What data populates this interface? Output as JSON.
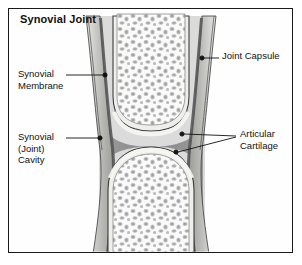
{
  "figure": {
    "title": "Synovial Joint",
    "frame_color": "#1a1a1a",
    "background": "#ffffff"
  },
  "labels": [
    {
      "id": "joint-capsule",
      "text": "Joint Capsule",
      "x": 222,
      "y": 54,
      "align": "left"
    },
    {
      "id": "synovial-membrane",
      "text_line1": "Synovial",
      "text_line2": "Membrane",
      "x": 18,
      "y": 72,
      "align": "left"
    },
    {
      "id": "synovial-cavity",
      "text_line1": "Synovial",
      "text_line2": "(Joint)",
      "text_line3": "Cavity",
      "x": 18,
      "y": 134,
      "align": "left"
    },
    {
      "id": "articular-cartilage",
      "text_line1": "Articular",
      "text_line2": "Cartilage",
      "x": 240,
      "y": 131,
      "align": "left"
    }
  ],
  "anatomy": {
    "parts": [
      {
        "name": "upper-bone",
        "description": "upper bone epiphysis with trabecular spongy bone"
      },
      {
        "name": "lower-bone",
        "description": "lower bone epiphysis with trabecular spongy bone"
      },
      {
        "name": "joint-capsule-wall",
        "description": "fibrous outer capsule walls on left and right"
      },
      {
        "name": "synovial-membrane",
        "description": "inner dark membrane lining the capsule"
      },
      {
        "name": "joint-cavity",
        "description": "dark synovial fluid filled cavity between bone ends"
      },
      {
        "name": "articular-cartilage",
        "description": "pale cartilage caps on opposing bone surfaces"
      }
    ],
    "colors": {
      "bone_marrow": "#f7f7f7",
      "cartilage": "#ededea",
      "capsule_outer": "#d8d8d4",
      "capsule_mid": "#a8a8a4",
      "membrane_dark": "#5d5d5d",
      "cavity": "#8e8e8e",
      "outline": "#2b2b2b",
      "leader": "#111111"
    }
  }
}
